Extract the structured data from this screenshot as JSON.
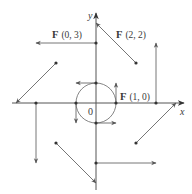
{
  "diagram": {
    "axes": {
      "x_label": "x",
      "y_label": "y",
      "origin_label": "0"
    },
    "labels": [
      {
        "id": "f03",
        "text_bold": "F",
        "text": "(0, 3)",
        "x": 52,
        "y": 38
      },
      {
        "id": "f22",
        "text_bold": "F",
        "text": "(2, 2)",
        "x": 116,
        "y": 38
      },
      {
        "id": "f10",
        "text_bold": "F",
        "text": "(1, 0)",
        "x": 120,
        "y": 100
      }
    ],
    "unit_px": 20,
    "origin_px": [
      96,
      103
    ],
    "circle_radius_units": 1,
    "points": [
      {
        "x": 0,
        "y": 1,
        "vector": [
          -1,
          0
        ]
      },
      {
        "x": 1,
        "y": 0,
        "vector": [
          0,
          1
        ]
      },
      {
        "x": 0,
        "y": -1,
        "vector": [
          1,
          0
        ]
      },
      {
        "x": -1,
        "y": 0,
        "vector": [
          0,
          -1
        ]
      },
      {
        "x": 0,
        "y": 3,
        "vector": [
          -3,
          0
        ]
      },
      {
        "x": 3,
        "y": 0,
        "vector": [
          0,
          3
        ]
      },
      {
        "x": 0,
        "y": -3,
        "vector": [
          3,
          0
        ]
      },
      {
        "x": -3,
        "y": 0,
        "vector": [
          0,
          -3
        ]
      },
      {
        "x": 2,
        "y": 2,
        "vector": [
          -2,
          2
        ]
      },
      {
        "x": -2,
        "y": 2,
        "vector": [
          -2,
          -2
        ]
      },
      {
        "x": -2,
        "y": -2,
        "vector": [
          2,
          -2
        ]
      },
      {
        "x": 2,
        "y": -2,
        "vector": [
          2,
          2
        ]
      }
    ],
    "colors": {
      "axis": "#555555",
      "vector": "#666666",
      "dot": "#333333",
      "text": "#3a3a3a"
    }
  }
}
